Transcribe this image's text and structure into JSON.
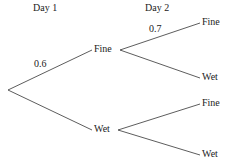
{
  "headers": {
    "day1": "Day 1",
    "day2": "Day 2"
  },
  "day1": {
    "fine": {
      "label": "Fine",
      "probability": "0.6"
    },
    "wet": {
      "label": "Wet",
      "probability": ""
    }
  },
  "day2": {
    "after_fine": {
      "fine": {
        "label": "Fine",
        "probability": "0.7"
      },
      "wet": {
        "label": "Wet",
        "probability": ""
      }
    },
    "after_wet": {
      "fine": {
        "label": "Fine",
        "probability": ""
      },
      "wet": {
        "label": "Wet",
        "probability": ""
      }
    }
  },
  "colors": {
    "line": "#333333",
    "text": "#222222",
    "background": "#ffffff"
  }
}
